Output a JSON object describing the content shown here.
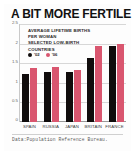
{
  "card": {
    "title": "A BIT MORE FERTILE",
    "subtitle_lines": [
      "AVERAGE LIFETIME BIRTHS",
      "PER WOMAN",
      "SELECTED LOW-BIRTH",
      "COUNTRIES"
    ],
    "source": "Data:Population Reference Bureau."
  },
  "colors": {
    "series_02": "#100c0c",
    "series_06": "#d9566f",
    "card_background": "#ffffff",
    "grid": "#d7d7d7",
    "axis": "#9a9a9a",
    "title_text": "#111111"
  },
  "chart_data": {
    "type": "bar",
    "title": "A BIT MORE FERTILE",
    "subtitle": "AVERAGE LIFETIME BIRTHS PER WOMAN SELECTED LOW-BIRTH COUNTRIES",
    "xlabel": "",
    "ylabel": "",
    "ylim": [
      0,
      2.5
    ],
    "yticks": [
      "0",
      "0.5",
      "1",
      "1.5",
      "2",
      "2.5"
    ],
    "ytick_values": [
      0,
      0.5,
      1,
      1.5,
      2,
      2.5
    ],
    "grid": true,
    "legend_position": "inside-top-left",
    "categories": [
      "SPAIN",
      "RUSSIA",
      "JAPAN",
      "BRITAIN",
      "FRANCE"
    ],
    "series": [
      {
        "name": "'02",
        "color": "#100c0c",
        "values": [
          1.25,
          1.3,
          1.3,
          1.65,
          1.95
        ]
      },
      {
        "name": "'06",
        "color": "#d9566f",
        "values": [
          1.4,
          1.42,
          1.35,
          1.95,
          2.0
        ]
      }
    ],
    "source": "Data:Population Reference Bureau."
  }
}
